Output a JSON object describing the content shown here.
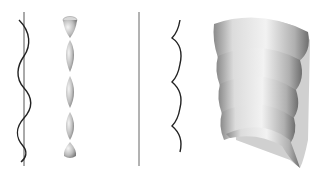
{
  "figure": {
    "panels": [
      {
        "id": "sinusoid-curve",
        "description": "Wavy curve around vertical axis"
      },
      {
        "id": "surface-of-revolution-1",
        "description": "Chain of lens-shaped pinched surfaces"
      },
      {
        "id": "scalloped-curve",
        "description": "Scalloped arc curve beside vertical axis"
      },
      {
        "id": "surface-of-revolution-2",
        "description": "Stacked helical shell surface"
      }
    ],
    "colors": {
      "curve": "#222222",
      "axis": "#555555",
      "surface_light": "#eeeeee",
      "surface_dark": "#888888"
    }
  }
}
